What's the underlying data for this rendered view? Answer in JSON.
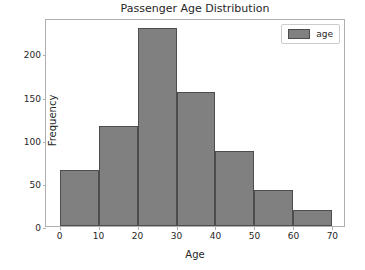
{
  "chart_data": {
    "type": "bar",
    "title": "Passenger Age Distribution",
    "xlabel": "Age",
    "ylabel": "Frequency",
    "categories": [
      "0-10",
      "10-20",
      "20-30",
      "30-40",
      "40-50",
      "50-60",
      "60-70"
    ],
    "bin_edges": [
      0,
      10,
      20,
      30,
      40,
      50,
      60,
      70
    ],
    "values": [
      65,
      116,
      230,
      155,
      87,
      42,
      18
    ],
    "series": [
      {
        "name": "age",
        "values": [
          65,
          116,
          230,
          155,
          87,
          42,
          18
        ]
      }
    ],
    "xlim": [
      -3.5,
      73.5
    ],
    "ylim": [
      0,
      241
    ],
    "xticks": [
      0,
      10,
      20,
      30,
      40,
      50,
      60,
      70
    ],
    "xtick_labels": [
      "0",
      "10",
      "20",
      "30",
      "40",
      "50",
      "60",
      "70"
    ],
    "yticks": [
      0,
      50,
      100,
      150,
      200
    ],
    "ytick_labels": [
      "0",
      "50",
      "100",
      "150",
      "200"
    ],
    "grid": false,
    "legend": {
      "position": "upper right",
      "entries": [
        {
          "label": "age",
          "color": "#808080",
          "edge_color": "#4d4d4d"
        }
      ]
    },
    "colors": {
      "bar_fill": "#808080",
      "bar_edge": "#4d4d4d",
      "axes_edge": "#b0b0b0",
      "text": "#262626",
      "background": "#ffffff"
    }
  }
}
